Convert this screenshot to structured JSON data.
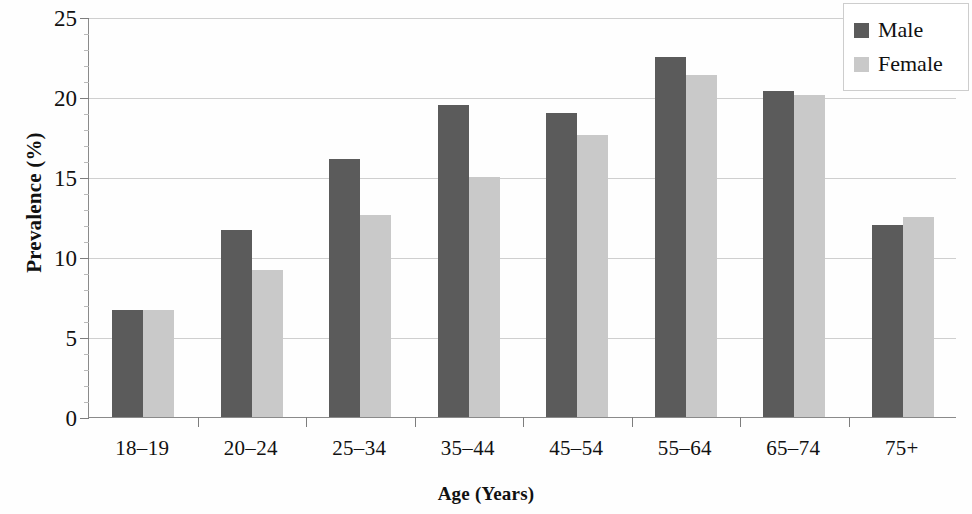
{
  "chart_data": {
    "type": "bar",
    "title": "",
    "xlabel": "Age (Years)",
    "ylabel": "Prevalence (%)",
    "categories": [
      "18–19",
      "20–24",
      "25–34",
      "35–44",
      "45–54",
      "55–64",
      "65–74",
      "75+"
    ],
    "series": [
      {
        "name": "Male",
        "color": "#5b5b5b",
        "values": [
          6.7,
          11.7,
          16.1,
          19.5,
          19.0,
          22.5,
          20.4,
          12.0
        ]
      },
      {
        "name": "Female",
        "color": "#c9c9c9",
        "values": [
          6.7,
          9.2,
          12.6,
          15.0,
          17.6,
          21.4,
          20.1,
          12.5
        ]
      }
    ],
    "ylim": [
      0,
      25
    ],
    "yticks": [
      0,
      5,
      10,
      15,
      20,
      25
    ],
    "ytick_labels": [
      "0",
      "5",
      "10",
      "15",
      "20",
      "25"
    ],
    "grid": true,
    "legend_position": "top-right",
    "legend_entries": [
      "Male",
      "Female"
    ]
  },
  "legend": {
    "male_label": "Male",
    "female_label": "Female"
  },
  "axes": {
    "y_title": "Prevalence (%)",
    "x_title": "Age (Years)"
  }
}
